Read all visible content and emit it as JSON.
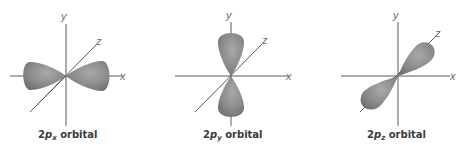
{
  "figure": {
    "colors": {
      "lobe_fill": "#8a8a8a",
      "lobe_highlight": "#a9a9a9",
      "lobe_shadow": "#6e6e6e",
      "axis": "#5a5a5a",
      "caption": "#3a3a3a"
    },
    "panels": [
      {
        "id": "2px",
        "axes": {
          "x": "x",
          "y": "y",
          "z": "z"
        },
        "caption": {
          "prefix": "2",
          "p": "p",
          "sub": "x",
          "suffix": " orbital"
        },
        "orientation": "horizontal"
      },
      {
        "id": "2py",
        "axes": {
          "x": "x",
          "y": "y",
          "z": "z"
        },
        "caption": {
          "prefix": "2",
          "p": "p",
          "sub": "y",
          "suffix": " orbital"
        },
        "orientation": "vertical"
      },
      {
        "id": "2pz",
        "axes": {
          "x": "x",
          "y": "y",
          "z": "z"
        },
        "caption": {
          "prefix": "2",
          "p": "p",
          "sub": "z",
          "suffix": " orbital"
        },
        "orientation": "diagonal"
      }
    ]
  }
}
